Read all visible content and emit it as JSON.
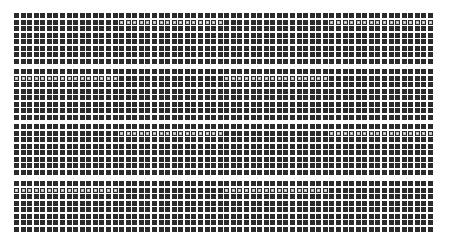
{
  "pattern": {
    "columns": 64,
    "rows_per_band": 8,
    "cell_pitch_x": 6.57,
    "cell_pitch_y": 6.5,
    "cell_size": 5,
    "band_tops": [
      0,
      56,
      111,
      168
    ],
    "colors": {
      "background": "#ffffff",
      "cell": "#2b2b2b",
      "highlight_fill": "#f4f4f4"
    },
    "bands": [
      {
        "highlight_row": 1,
        "highlight_ranges": [
          [
            16,
            31
          ],
          [
            48,
            63
          ]
        ]
      },
      {
        "highlight_row": 1,
        "highlight_ranges": [
          [
            0,
            15
          ],
          [
            32,
            47
          ]
        ]
      },
      {
        "highlight_row": 1,
        "highlight_ranges": [
          [
            16,
            31
          ],
          [
            48,
            63
          ]
        ]
      },
      {
        "highlight_row": 1,
        "highlight_ranges": [
          [
            0,
            15
          ],
          [
            32,
            47
          ]
        ]
      }
    ]
  }
}
